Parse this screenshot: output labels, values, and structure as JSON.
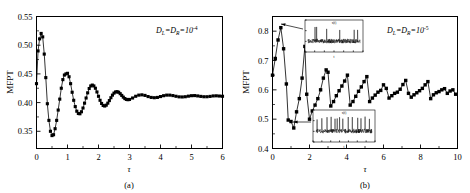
{
  "figure": {
    "panel_a_letter": "(a)",
    "panel_b_letter": "(b)"
  },
  "chart_data": [
    {
      "type": "line",
      "panel": "(a)",
      "title": "",
      "xlabel": "τ",
      "ylabel": "MFPT",
      "xlim": [
        0,
        6
      ],
      "ylim": [
        0.32,
        0.55
      ],
      "xticks": [
        0,
        1,
        2,
        3,
        4,
        5,
        6
      ],
      "xtick_labels": [
        "0",
        "1",
        "2",
        "3",
        "4",
        "5",
        "6"
      ],
      "yticks": [
        0.35,
        0.4,
        0.45,
        0.5,
        0.55
      ],
      "ytick_labels": [
        "0.35",
        "0.40",
        "0.45",
        "0.50",
        "0.55"
      ],
      "grid": false,
      "legend": "none",
      "annotation": {
        "text_parts": [
          "D",
          "L",
          "=D",
          "R",
          "=10",
          "-4"
        ],
        "plain": "D_L=D_R=10^-4",
        "x": 4.05,
        "y": 0.532
      },
      "marker": "filled-square",
      "marker_color": "#000000",
      "line_color": "#000000",
      "x": [
        0.0,
        0.05,
        0.1,
        0.15,
        0.2,
        0.25,
        0.3,
        0.35,
        0.4,
        0.45,
        0.5,
        0.55,
        0.6,
        0.65,
        0.7,
        0.75,
        0.8,
        0.85,
        0.9,
        0.95,
        1.0,
        1.05,
        1.1,
        1.15,
        1.2,
        1.25,
        1.3,
        1.35,
        1.4,
        1.45,
        1.5,
        1.55,
        1.6,
        1.65,
        1.7,
        1.75,
        1.8,
        1.85,
        1.9,
        1.95,
        2.0,
        2.05,
        2.1,
        2.15,
        2.2,
        2.25,
        2.3,
        2.35,
        2.4,
        2.45,
        2.5,
        2.55,
        2.6,
        2.65,
        2.7,
        2.75,
        2.8,
        2.85,
        2.9,
        2.95,
        3.0,
        3.1,
        3.2,
        3.3,
        3.4,
        3.5,
        3.6,
        3.7,
        3.8,
        3.9,
        4.0,
        4.1,
        4.2,
        4.3,
        4.4,
        4.5,
        4.6,
        4.7,
        4.8,
        4.9,
        5.0,
        5.1,
        5.2,
        5.3,
        5.4,
        5.5,
        5.6,
        5.7,
        5.8,
        5.9,
        6.0
      ],
      "y": [
        0.433,
        0.49,
        0.511,
        0.5205,
        0.5145,
        0.4845,
        0.4435,
        0.398,
        0.369,
        0.35,
        0.3425,
        0.344,
        0.3545,
        0.369,
        0.387,
        0.406,
        0.425,
        0.44,
        0.448,
        0.45,
        0.451,
        0.445,
        0.433,
        0.418,
        0.404,
        0.393,
        0.385,
        0.381,
        0.3805,
        0.384,
        0.3905,
        0.399,
        0.408,
        0.417,
        0.4245,
        0.429,
        0.4305,
        0.429,
        0.425,
        0.4185,
        0.411,
        0.404,
        0.3985,
        0.395,
        0.394,
        0.3955,
        0.399,
        0.4035,
        0.4085,
        0.413,
        0.4165,
        0.4185,
        0.419,
        0.418,
        0.4155,
        0.4125,
        0.4095,
        0.407,
        0.4055,
        0.405,
        0.4055,
        0.408,
        0.411,
        0.413,
        0.4135,
        0.4125,
        0.4105,
        0.409,
        0.4085,
        0.409,
        0.4105,
        0.412,
        0.413,
        0.413,
        0.4122,
        0.411,
        0.41,
        0.4098,
        0.4102,
        0.4112,
        0.412,
        0.4122,
        0.4116,
        0.4108,
        0.4102,
        0.4102,
        0.4108,
        0.4116,
        0.4118,
        0.4114,
        0.411
      ]
    },
    {
      "type": "line",
      "panel": "(b)",
      "title": "",
      "xlabel": "τ",
      "ylabel": "MFPT",
      "xlim": [
        0,
        10
      ],
      "ylim": [
        0.4,
        0.85
      ],
      "xticks": [
        0,
        2,
        4,
        6,
        8,
        10
      ],
      "xtick_labels": [
        "0",
        "2",
        "4",
        "6",
        "8",
        "10"
      ],
      "yticks": [
        0.4,
        0.5,
        0.6,
        0.7,
        0.8
      ],
      "ytick_labels": [
        "0.4",
        "0.5",
        "0.6",
        "0.7",
        "0.8"
      ],
      "grid": false,
      "legend": "none",
      "annotation": {
        "text_parts": [
          "D",
          "L",
          "=D",
          "R",
          "=10",
          "-5"
        ],
        "plain": "D_L=D_R=10^-5",
        "x": 6.9,
        "y": 0.815
      },
      "marker": "filled-square",
      "marker_color": "#000000",
      "line_color": "#000000",
      "x": [
        0.0,
        0.15,
        0.3,
        0.45,
        0.6,
        0.75,
        0.85,
        1.0,
        1.15,
        1.3,
        1.45,
        1.6,
        1.75,
        1.85,
        2.0,
        2.15,
        2.3,
        2.45,
        2.6,
        2.75,
        2.9,
        3.0,
        3.15,
        3.3,
        3.45,
        3.6,
        3.75,
        3.9,
        4.05,
        4.2,
        4.35,
        4.5,
        4.65,
        4.8,
        4.95,
        5.1,
        5.25,
        5.4,
        5.55,
        5.7,
        5.85,
        6.0,
        6.15,
        6.3,
        6.45,
        6.6,
        6.75,
        6.9,
        7.05,
        7.2,
        7.35,
        7.5,
        7.65,
        7.8,
        7.95,
        8.1,
        8.25,
        8.4,
        8.55,
        8.7,
        8.85,
        9.0,
        9.15,
        9.3,
        9.45,
        9.6,
        9.75,
        9.9
      ],
      "y": [
        0.65,
        0.707,
        0.77,
        0.812,
        0.74,
        0.62,
        0.497,
        0.492,
        0.47,
        0.525,
        0.57,
        0.64,
        0.748,
        0.585,
        0.5,
        0.528,
        0.548,
        0.57,
        0.6,
        0.64,
        0.668,
        0.66,
        0.545,
        0.56,
        0.58,
        0.597,
        0.613,
        0.63,
        0.65,
        0.548,
        0.56,
        0.578,
        0.595,
        0.61,
        0.628,
        0.645,
        0.56,
        0.572,
        0.582,
        0.592,
        0.598,
        0.617,
        0.605,
        0.572,
        0.58,
        0.588,
        0.592,
        0.602,
        0.618,
        0.632,
        0.588,
        0.575,
        0.583,
        0.59,
        0.597,
        0.605,
        0.617,
        0.628,
        0.57,
        0.583,
        0.59,
        0.594,
        0.6,
        0.604,
        0.588,
        0.596,
        0.6,
        0.585
      ]
    }
  ],
  "insets": [
    {
      "name": "top-inset",
      "parent_panel": "(b)",
      "description": "noisy time series with sparse large spikes",
      "xlabel": "t",
      "ylabel": "x(t)",
      "points_at": {
        "x": 0.45,
        "y": 0.812
      }
    },
    {
      "name": "bottom-inset",
      "parent_panel": "(b)",
      "description": "noisy time series with dense regular spikes",
      "xlabel": "t",
      "ylabel": "x(t)",
      "points_at": {
        "x": 0.85,
        "y": 0.47
      }
    }
  ]
}
